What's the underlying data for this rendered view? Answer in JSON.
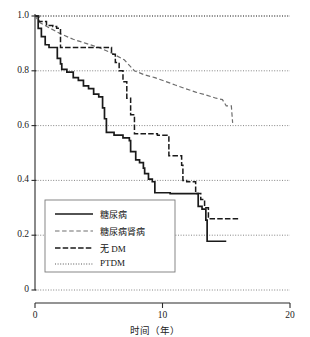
{
  "chart_data": {
    "type": "line",
    "title": "",
    "xlabel": "时间（年）",
    "ylabel": "",
    "xlim": [
      0,
      20
    ],
    "ylim": [
      0,
      1.0
    ],
    "xticks": [
      "0",
      "10",
      "20"
    ],
    "xtick_values": [
      0,
      10,
      20
    ],
    "yticks": [
      "0",
      "0.2",
      "0.4",
      "0.6",
      "0.8",
      "1.0"
    ],
    "ytick_values": [
      0,
      0.2,
      0.4,
      0.6,
      0.8,
      1.0
    ],
    "grid": true,
    "grid_style": "dotted",
    "grid_axis": "y",
    "step_type": "post",
    "legend_position": "lower-left",
    "series": [
      {
        "name": "糖尿病",
        "style": "solid",
        "color": "#1a1a1a",
        "x": [
          0,
          0.25,
          0.5,
          0.8,
          1.1,
          1.4,
          1.7,
          1.75,
          2.0,
          2.1,
          2.5,
          3.0,
          3.4,
          3.8,
          4.2,
          4.6,
          5.0,
          5.3,
          5.45,
          5.6,
          6.2,
          6.9,
          7.4,
          7.5,
          7.9,
          8.2,
          8.5,
          8.6,
          8.9,
          9.2,
          9.4,
          10.6,
          11.6,
          12.4,
          12.8,
          13.1,
          13.4,
          13.5,
          15.0
        ],
        "y": [
          1.0,
          0.955,
          0.925,
          0.895,
          0.885,
          0.885,
          0.885,
          0.845,
          0.825,
          0.805,
          0.795,
          0.775,
          0.765,
          0.745,
          0.735,
          0.715,
          0.705,
          0.665,
          0.625,
          0.575,
          0.565,
          0.555,
          0.545,
          0.505,
          0.475,
          0.465,
          0.445,
          0.425,
          0.405,
          0.395,
          0.355,
          0.352,
          0.352,
          0.352,
          0.305,
          0.295,
          0.255,
          0.178,
          0.178
        ]
      },
      {
        "name": "糖尿病肾病",
        "style": "dashed",
        "color": "#6e6e6e",
        "x": [
          0,
          0.4,
          1.2,
          2.0,
          3.0,
          4.0,
          5.0,
          6.0,
          7.0,
          7.8,
          8.6,
          9.4,
          10.2,
          11.0,
          11.8,
          12.6,
          13.4,
          14.2,
          14.7,
          15.0,
          15.4,
          15.5
        ],
        "y": [
          1.0,
          0.975,
          0.955,
          0.935,
          0.915,
          0.9,
          0.885,
          0.865,
          0.84,
          0.8,
          0.785,
          0.775,
          0.762,
          0.748,
          0.735,
          0.722,
          0.712,
          0.7,
          0.695,
          0.672,
          0.672,
          0.61
        ]
      },
      {
        "name": "无 DM",
        "style": "dashdot",
        "color": "#1a1a1a",
        "x": [
          0,
          0.3,
          0.9,
          1.4,
          1.7,
          2.0,
          5.6,
          6.0,
          6.3,
          6.6,
          6.9,
          7.2,
          7.5,
          7.8,
          9.4,
          9.6,
          10.3,
          10.5,
          11.3,
          11.5,
          11.6,
          11.9,
          12.6,
          13.0,
          13.3,
          13.6,
          16.0
        ],
        "y": [
          1.0,
          0.98,
          0.965,
          0.962,
          0.955,
          0.885,
          0.885,
          0.86,
          0.83,
          0.8,
          0.76,
          0.7,
          0.64,
          0.57,
          0.57,
          0.565,
          0.565,
          0.49,
          0.49,
          0.455,
          0.4,
          0.395,
          0.352,
          0.33,
          0.3,
          0.26,
          0.26
        ]
      },
      {
        "name": "PTDM",
        "style": "dotted",
        "color": "#444444",
        "x": [
          0,
          20
        ],
        "y": [
          1.0,
          1.0
        ]
      }
    ]
  },
  "legend": {
    "items": [
      {
        "label": "糖尿病",
        "style": "solid"
      },
      {
        "label": "糖尿病肾病",
        "style": "dashed"
      },
      {
        "label": "无 DM",
        "style": "dashdot"
      },
      {
        "label": "PTDM",
        "style": "dotted"
      }
    ]
  }
}
